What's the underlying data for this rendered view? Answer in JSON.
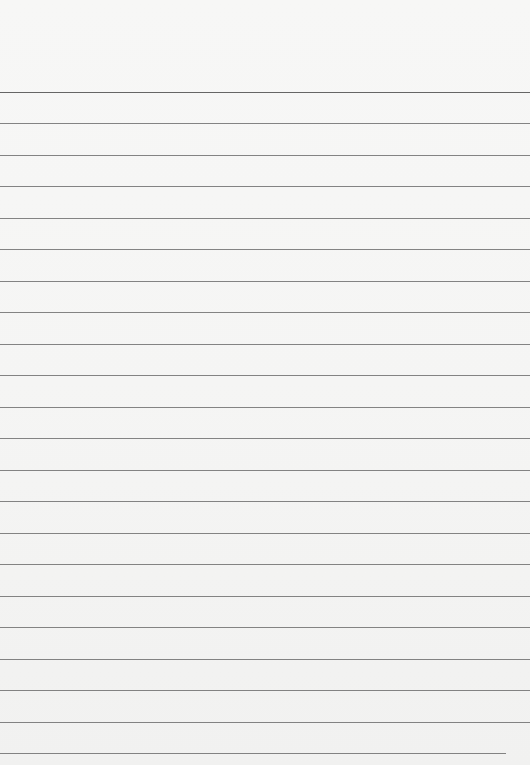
{
  "document": {
    "type": "lined-paper",
    "background_color": "#f5f5f4",
    "rule_color": "#6f6f6f",
    "rules": [
      {
        "y": 92,
        "x_end": 530
      },
      {
        "y": 123,
        "x_end": 530
      },
      {
        "y": 155,
        "x_end": 530
      },
      {
        "y": 186,
        "x_end": 530
      },
      {
        "y": 218,
        "x_end": 530
      },
      {
        "y": 249,
        "x_end": 530
      },
      {
        "y": 281,
        "x_end": 530
      },
      {
        "y": 312,
        "x_end": 530
      },
      {
        "y": 344,
        "x_end": 530
      },
      {
        "y": 375,
        "x_end": 530
      },
      {
        "y": 407,
        "x_end": 530
      },
      {
        "y": 438,
        "x_end": 530
      },
      {
        "y": 470,
        "x_end": 530
      },
      {
        "y": 501,
        "x_end": 530
      },
      {
        "y": 533,
        "x_end": 530
      },
      {
        "y": 564,
        "x_end": 530
      },
      {
        "y": 596,
        "x_end": 530
      },
      {
        "y": 627,
        "x_end": 530
      },
      {
        "y": 659,
        "x_end": 530
      },
      {
        "y": 690,
        "x_end": 530
      },
      {
        "y": 722,
        "x_end": 530
      },
      {
        "y": 753,
        "x_end": 506
      }
    ]
  }
}
